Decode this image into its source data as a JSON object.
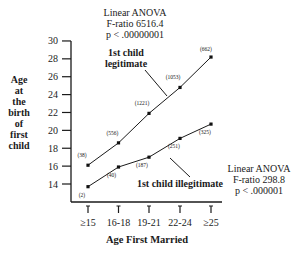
{
  "chart_data": {
    "type": "line",
    "title": "",
    "xlabel": "Age First Married",
    "ylabel_lines": [
      "Age",
      "at",
      "the",
      "birth",
      "of",
      "first",
      "child"
    ],
    "ylabel": "Age at the birth of first child",
    "categories": [
      "≥15",
      "16-18",
      "19-21",
      "22-24",
      "≥25"
    ],
    "yticks": [
      14,
      16,
      18,
      20,
      22,
      24,
      26,
      28,
      30
    ],
    "ylim": [
      12.2,
      30
    ],
    "grid": false,
    "legend": "none",
    "series": [
      {
        "name": "1st child legitimate",
        "label_lines": [
          "1st child",
          "legitimate"
        ],
        "values": [
          16.1,
          18.6,
          21.9,
          24.8,
          28.2
        ],
        "n": [
          "(38)",
          "(556)",
          "(1221)",
          "(1053)",
          "(662)"
        ]
      },
      {
        "name": "1st child illegitimate",
        "label_lines": [
          "1st child illegitimate"
        ],
        "values": [
          13.7,
          15.9,
          17.0,
          19.1,
          20.7
        ],
        "n": [
          "(2)",
          "(40)",
          "(187)",
          "(251)",
          "(325)"
        ]
      }
    ],
    "annotations": [
      {
        "lines": [
          "Linear ANOVA",
          "F-ratio 6516.4",
          "p < .00000001"
        ],
        "applies_to": "1st child legitimate"
      },
      {
        "lines": [
          "Linear ANOVA",
          "F-ratio 298.8",
          "p < .000001"
        ],
        "applies_to": "1st child illegitimate"
      }
    ]
  }
}
